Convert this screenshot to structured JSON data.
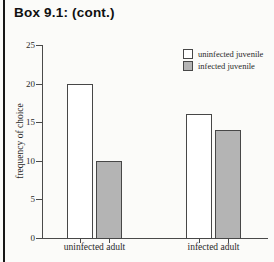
{
  "page": {
    "box_title": "Box 9.1: (cont.)"
  },
  "chart_data": {
    "type": "bar",
    "title": "",
    "categories": [
      "uninfected adult",
      "infected adult"
    ],
    "series": [
      {
        "name": "uninfected juvenile",
        "values": [
          20,
          16
        ],
        "fill": "#ffffff"
      },
      {
        "name": "infected juvenile",
        "values": [
          10,
          14
        ],
        "fill": "#b4b4b4"
      }
    ],
    "xlabel": "",
    "ylabel": "frequency of choice",
    "ylim": [
      0,
      25
    ],
    "yticks": [
      0,
      5,
      10,
      15,
      20,
      25
    ],
    "grid": false,
    "legend_position": "top-right"
  },
  "colors": {
    "background": "#fbfbf9",
    "axis": "#4a4a4a",
    "text": "#2a2a2a",
    "bar_outline": "#474747",
    "bar_white": "#ffffff",
    "bar_gray": "#b4b4b4",
    "left_rule": "#161616"
  }
}
